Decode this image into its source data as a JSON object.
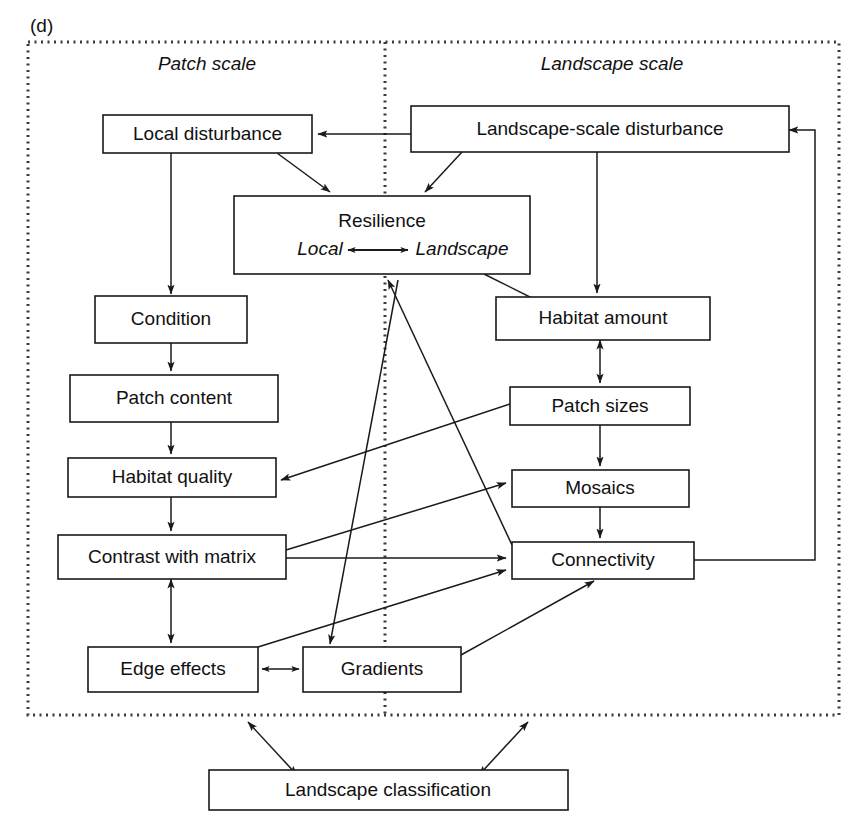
{
  "figure": {
    "panel_label": "(d)",
    "background_color": "#ffffff",
    "line_color": "#1a1a1a",
    "frame_color": "#3a3a3a"
  },
  "scale_headings": [
    {
      "id": "patch-scale",
      "label": "Patch scale"
    },
    {
      "id": "landscape-scale",
      "label": "Landscape scale"
    }
  ],
  "boxes": [
    {
      "id": "local-disturbance",
      "label": "Local disturbance"
    },
    {
      "id": "landscape-scale-disturbance",
      "label": "Landscape-scale disturbance"
    },
    {
      "id": "resilience",
      "label": "Resilience",
      "sub_left": "Local",
      "sub_right": "Landscape"
    },
    {
      "id": "condition",
      "label": "Condition"
    },
    {
      "id": "patch-content",
      "label": "Patch content"
    },
    {
      "id": "habitat-quality",
      "label": "Habitat quality"
    },
    {
      "id": "contrast-with-matrix",
      "label": "Contrast with matrix"
    },
    {
      "id": "edge-effects",
      "label": "Edge effects"
    },
    {
      "id": "gradients",
      "label": "Gradients"
    },
    {
      "id": "habitat-amount",
      "label": "Habitat amount"
    },
    {
      "id": "patch-sizes",
      "label": "Patch sizes"
    },
    {
      "id": "mosaics",
      "label": "Mosaics"
    },
    {
      "id": "connectivity",
      "label": "Connectivity"
    },
    {
      "id": "landscape-classification",
      "label": "Landscape classification"
    }
  ],
  "connections": [
    {
      "from": "landscape-scale-disturbance",
      "to": "local-disturbance",
      "arrow": "single"
    },
    {
      "from": "local-disturbance",
      "to": "resilience",
      "arrow": "single"
    },
    {
      "from": "landscape-scale-disturbance",
      "to": "resilience",
      "arrow": "single"
    },
    {
      "from": "local-disturbance",
      "to": "condition",
      "arrow": "single"
    },
    {
      "from": "condition",
      "to": "patch-content",
      "arrow": "single"
    },
    {
      "from": "patch-content",
      "to": "habitat-quality",
      "arrow": "single"
    },
    {
      "from": "habitat-quality",
      "to": "contrast-with-matrix",
      "arrow": "single"
    },
    {
      "from": "contrast-with-matrix",
      "to": "edge-effects",
      "arrow": "double"
    },
    {
      "from": "edge-effects",
      "to": "gradients",
      "arrow": "double"
    },
    {
      "from": "resilience",
      "to": "habitat-amount",
      "arrow": "single"
    },
    {
      "from": "landscape-scale-disturbance",
      "to": "habitat-amount",
      "arrow": "single"
    },
    {
      "from": "habitat-amount",
      "to": "patch-sizes",
      "arrow": "double"
    },
    {
      "from": "patch-sizes",
      "to": "mosaics",
      "arrow": "single"
    },
    {
      "from": "mosaics",
      "to": "connectivity",
      "arrow": "single"
    },
    {
      "from": "patch-sizes",
      "to": "habitat-quality",
      "arrow": "single"
    },
    {
      "from": "contrast-with-matrix",
      "to": "mosaics",
      "arrow": "single"
    },
    {
      "from": "contrast-with-matrix",
      "to": "connectivity",
      "arrow": "single"
    },
    {
      "from": "edge-effects",
      "to": "connectivity",
      "arrow": "single"
    },
    {
      "from": "gradients",
      "to": "connectivity",
      "arrow": "single"
    },
    {
      "from": "connectivity",
      "to": "resilience",
      "arrow": "single"
    },
    {
      "from": "resilience",
      "to": "gradients",
      "arrow": "single"
    },
    {
      "from": "connectivity",
      "to": "landscape-scale-disturbance",
      "arrow": "single"
    },
    {
      "from": "landscape-classification",
      "to": "patch-scale-region",
      "arrow": "double"
    },
    {
      "from": "landscape-classification",
      "to": "landscape-scale-region",
      "arrow": "double"
    }
  ]
}
